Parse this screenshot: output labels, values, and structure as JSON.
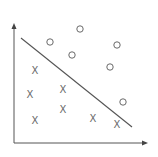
{
  "diagram": {
    "type": "linear-classifier-scatter",
    "colors": {
      "background": "#ffffff",
      "axis": "#555555",
      "points": "#6a6a6a"
    },
    "axes": {
      "origin": [
        14,
        143
      ],
      "x_end": [
        148,
        143
      ],
      "y_end": [
        14,
        23
      ]
    },
    "decision_boundary": {
      "from": [
        21,
        38
      ],
      "to": [
        132,
        127
      ]
    },
    "class_circle": {
      "marker": "O",
      "points": [
        [
          80,
          29
        ],
        [
          50,
          42
        ],
        [
          72,
          55
        ],
        [
          117,
          45
        ],
        [
          110,
          67
        ],
        [
          123,
          102
        ]
      ]
    },
    "class_cross": {
      "marker": "X",
      "points": [
        [
          35,
          70
        ],
        [
          30,
          94
        ],
        [
          63,
          89
        ],
        [
          63,
          109
        ],
        [
          35,
          120
        ],
        [
          93,
          118
        ],
        [
          117,
          124
        ]
      ]
    }
  }
}
